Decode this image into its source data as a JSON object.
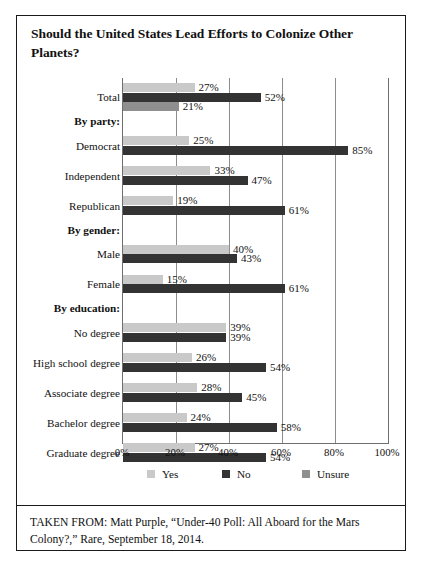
{
  "figure": {
    "title": "Should the United States Lead Efforts to Colonize Other Planets?",
    "source_note": "TAKEN FROM: Matt Purple, “Under-40 Poll: All Aboard for the Mars Colony?,” Rare, September 18, 2014."
  },
  "colors": {
    "yes": "#c9c9c9",
    "no": "#333333",
    "unsure": "#8f8f8f",
    "gridline": "#8d8d8d",
    "frame": "#1a1a1a"
  },
  "legend": {
    "position": "bottom",
    "items": [
      {
        "label": "Yes",
        "color": "#c9c9c9",
        "icon": "legend-swatch-yes"
      },
      {
        "label": "No",
        "color": "#333333",
        "icon": "legend-swatch-no"
      },
      {
        "label": "Unsure",
        "color": "#8f8f8f",
        "icon": "legend-swatch-unsure"
      }
    ]
  },
  "chart_data": {
    "type": "bar",
    "orientation": "horizontal",
    "title": "Should the United States Lead Efforts to Colonize Other Planets?",
    "xlabel": "",
    "ylabel": "",
    "xlim": [
      0,
      100
    ],
    "xticks": [
      "0%",
      "20%",
      "40%",
      "60%",
      "80%",
      "100%"
    ],
    "xtick_values": [
      0,
      20,
      40,
      60,
      80,
      100
    ],
    "grid": "vertical",
    "value_suffix": "%",
    "series": [
      {
        "name": "Yes",
        "color": "#c9c9c9"
      },
      {
        "name": "No",
        "color": "#333333"
      },
      {
        "name": "Unsure",
        "color": "#8f8f8f"
      }
    ],
    "rows": [
      {
        "label": "Total",
        "type": "data",
        "yes": 27,
        "no": 52,
        "unsure": 21,
        "yes_label": "27%",
        "no_label": "52%",
        "unsure_label": "21%"
      },
      {
        "label": "By party:",
        "type": "header"
      },
      {
        "label": "Democrat",
        "type": "data",
        "yes": 25,
        "no": 85,
        "unsure": null,
        "yes_label": "25%",
        "no_label": "85%",
        "unsure_label": ""
      },
      {
        "label": "Independent",
        "type": "data",
        "yes": 33,
        "no": 47,
        "unsure": null,
        "yes_label": "33%",
        "no_label": "47%",
        "unsure_label": ""
      },
      {
        "label": "Republican",
        "type": "data",
        "yes": 19,
        "no": 61,
        "unsure": null,
        "yes_label": "19%",
        "no_label": "61%",
        "unsure_label": ""
      },
      {
        "label": "By gender:",
        "type": "header"
      },
      {
        "label": "Male",
        "type": "data",
        "yes": 40,
        "no": 43,
        "unsure": null,
        "yes_label": "40%",
        "no_label": "43%",
        "unsure_label": ""
      },
      {
        "label": "Female",
        "type": "data",
        "yes": 15,
        "no": 61,
        "unsure": null,
        "yes_label": "15%",
        "no_label": "61%",
        "unsure_label": ""
      },
      {
        "label": "By education:",
        "type": "header"
      },
      {
        "label": "No degree",
        "type": "data",
        "yes": 39,
        "no": 39,
        "unsure": null,
        "yes_label": "39%",
        "no_label": "39%",
        "unsure_label": ""
      },
      {
        "label": "High school degree",
        "type": "data",
        "yes": 26,
        "no": 54,
        "unsure": null,
        "yes_label": "26%",
        "no_label": "54%",
        "unsure_label": ""
      },
      {
        "label": "Associate degree",
        "type": "data",
        "yes": 28,
        "no": 45,
        "unsure": null,
        "yes_label": "28%",
        "no_label": "45%",
        "unsure_label": ""
      },
      {
        "label": "Bachelor degree",
        "type": "data",
        "yes": 24,
        "no": 58,
        "unsure": null,
        "yes_label": "24%",
        "no_label": "58%",
        "unsure_label": ""
      },
      {
        "label": "Graduate degree",
        "type": "data",
        "yes": 27,
        "no": 54,
        "unsure": null,
        "yes_label": "27%",
        "no_label": "54%",
        "unsure_label": ""
      }
    ]
  }
}
